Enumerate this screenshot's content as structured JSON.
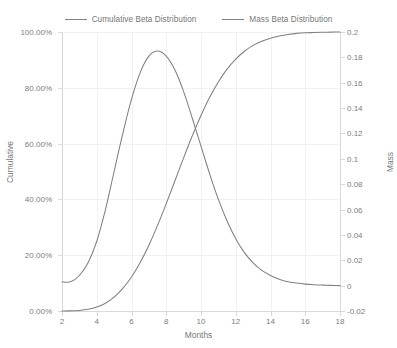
{
  "chart_data": {
    "type": "line",
    "title": "",
    "xlabel": "Months",
    "ylabel": "Cumulative",
    "y2label": "Mass",
    "grid": true,
    "legend_position": "top-center",
    "xlim": [
      2,
      18
    ],
    "ylim": [
      0,
      1
    ],
    "y2lim": [
      -0.02,
      0.2
    ],
    "xticks": [
      2,
      4,
      6,
      8,
      10,
      12,
      14,
      16,
      18
    ],
    "xtick_labels": [
      "2",
      "4",
      "6",
      "8",
      "10",
      "12",
      "14",
      "16",
      "18"
    ],
    "yticks": [
      0,
      0.2,
      0.4,
      0.6,
      0.8,
      1
    ],
    "ytick_labels": [
      "0.00%",
      "20.00%",
      "40.00%",
      "60.00%",
      "80.00%",
      "100.00%"
    ],
    "y2ticks": [
      -0.02,
      0,
      0.02,
      0.04,
      0.06,
      0.08,
      0.1,
      0.12,
      0.14,
      0.16,
      0.18,
      0.2
    ],
    "y2tick_labels": [
      "-0.02",
      "0",
      "0.02",
      "0.04",
      "0.06",
      "0.08",
      "0.1",
      "0.12",
      "0.14",
      "0.16",
      "0.18",
      "0.2"
    ],
    "series": [
      {
        "name": "Cumulative Beta Distribution",
        "axis": "left",
        "color": "#808080",
        "x": [
          2,
          2.5,
          3,
          3.5,
          4,
          4.5,
          5,
          5.5,
          6,
          6.5,
          7,
          7.5,
          8,
          8.5,
          9,
          9.5,
          10,
          10.5,
          11,
          11.5,
          12,
          12.5,
          13,
          13.5,
          14,
          14.5,
          15,
          15.5,
          16,
          16.5,
          17,
          17.5,
          18
        ],
        "values": [
          0.0,
          0.0005,
          0.002,
          0.006,
          0.014,
          0.028,
          0.05,
          0.081,
          0.122,
          0.174,
          0.236,
          0.307,
          0.385,
          0.467,
          0.549,
          0.628,
          0.701,
          0.766,
          0.821,
          0.867,
          0.903,
          0.931,
          0.952,
          0.967,
          0.978,
          0.986,
          0.991,
          0.995,
          0.997,
          0.998,
          0.999,
          0.9995,
          1.0
        ]
      },
      {
        "name": "Mass Beta Distribution",
        "axis": "right",
        "color": "#808080",
        "x": [
          2,
          2.5,
          3,
          3.5,
          4,
          4.5,
          5,
          5.5,
          6,
          6.5,
          7,
          7.5,
          8,
          8.5,
          9,
          9.5,
          10,
          10.5,
          11,
          11.5,
          12,
          12.5,
          13,
          13.5,
          14,
          14.5,
          15,
          15.5,
          16,
          16.5,
          17,
          17.5,
          18
        ],
        "values": [
          0.003,
          0.003,
          0.008,
          0.018,
          0.035,
          0.06,
          0.09,
          0.12,
          0.147,
          0.168,
          0.181,
          0.185,
          0.181,
          0.17,
          0.153,
          0.132,
          0.11,
          0.088,
          0.068,
          0.051,
          0.037,
          0.026,
          0.018,
          0.012,
          0.008,
          0.005,
          0.003,
          0.002,
          0.0012,
          0.0007,
          0.0004,
          0.0002,
          0.0
        ]
      }
    ],
    "annotations": {
      "peak_mass_x": 7.5,
      "peak_mass_value": 0.185,
      "crossover_x": 9.0
    }
  },
  "legend": {
    "items": [
      {
        "label": "Cumulative Beta Distribution",
        "color": "#808080"
      },
      {
        "label": "Mass Beta Distribution",
        "color": "#808080"
      }
    ]
  },
  "axes": {
    "x_title": "Months",
    "left_title": "Cumulative",
    "right_title": "Mass"
  },
  "colors": {
    "series_line": "#808080",
    "gridline": "#f1f1f1",
    "axis_line": "#d9d9d9",
    "tick_text": "#7d7d7d",
    "background": "#ffffff"
  }
}
